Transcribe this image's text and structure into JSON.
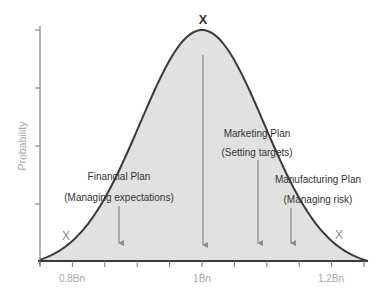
{
  "chart_data": {
    "type": "area",
    "title": "",
    "xlabel": "",
    "ylabel": "Probability",
    "distribution": "normal",
    "mean": 1.0,
    "std": 0.1,
    "xlim": [
      0.75,
      1.25
    ],
    "x_ticks": [
      0.75,
      0.8,
      0.85,
      0.9,
      0.95,
      1.0,
      1.05,
      1.1,
      1.15,
      1.2,
      1.25
    ],
    "x_tick_labels": [
      {
        "value": 0.8,
        "label": "0.8Bn"
      },
      {
        "value": 1.0,
        "label": "1Bn"
      },
      {
        "value": 1.2,
        "label": "1.2Bn"
      }
    ],
    "y_ticks": 5,
    "grid": false,
    "legend": null,
    "markers": [
      {
        "label": "X",
        "x": 0.83,
        "position": "left tail"
      },
      {
        "label": "X",
        "x": 1.0,
        "position": "peak"
      },
      {
        "label": "X",
        "x": 1.21,
        "position": "right tail"
      }
    ],
    "annotations": [
      {
        "title": "Financial Plan",
        "subtitle": "(Managing expectations)",
        "arrow_x": 0.87
      },
      {
        "title": "Marketing Plan",
        "subtitle": "(Setting targets)",
        "arrow_x": 1.0,
        "arrow_from_peak": true
      },
      {
        "title": "Marketing Plan",
        "subtitle": "(Setting targets)",
        "arrow_x": 1.085
      },
      {
        "title": "Manufacturing Plan",
        "subtitle": "(Managing risk)",
        "arrow_x": 1.135
      }
    ]
  },
  "labels": {
    "ylabel": "Probability",
    "x_tick_08": "0.8Bn",
    "x_tick_10": "1Bn",
    "x_tick_12": "1.2Bn",
    "marker_left": "X",
    "marker_peak": "X",
    "marker_right": "X",
    "financial_title": "Financial Plan",
    "financial_subtitle": "(Managing expectations)",
    "marketing_title": "Marketing Plan",
    "marketing_subtitle": "(Setting targets)",
    "manufacturing_title": "Manufacturing Plan",
    "manufacturing_subtitle": "(Managing risk)"
  },
  "colors": {
    "fill": "#e1e1e1",
    "curve": "#3a3a3a",
    "axis": "#555555",
    "arrow": "#8c8c8c",
    "text": "#333333",
    "muted_text": "#a8a8a8",
    "marker_gray": "#8a8a8a",
    "marker_dark": "#333333"
  }
}
